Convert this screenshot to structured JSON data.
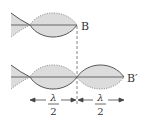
{
  "diagram": {
    "type": "standing-wave-comparison",
    "colors": {
      "fill": "#dcdcdc",
      "solid_line": "#555555",
      "dotted_line": "#8a8a8a",
      "axis": "#666666",
      "text": "#333333"
    },
    "top_wave": {
      "end_label": "B",
      "half_wavelengths": 1
    },
    "bottom_wave": {
      "end_label": "B′",
      "half_wavelengths": 2
    },
    "dimensions": [
      {
        "numerator": "λ",
        "denominator": "2"
      },
      {
        "numerator": "λ",
        "denominator": "2"
      }
    ]
  }
}
